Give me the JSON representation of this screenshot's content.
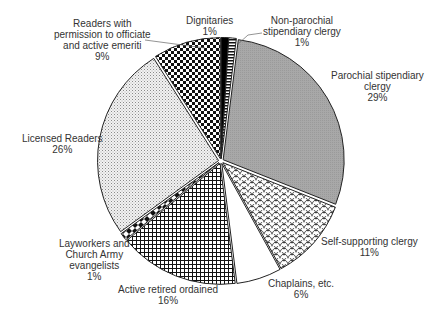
{
  "chart_data": {
    "type": "pie",
    "title": "",
    "start_angle_deg": 0,
    "direction": "clockwise",
    "slices": [
      {
        "label": "Dignitaries",
        "value": 1,
        "pct_label": "1%",
        "pattern": "solid-black"
      },
      {
        "label": "Non-parochial stipendiary clergy",
        "value": 1,
        "pct_label": "1%",
        "pattern": "horizontal-stripes"
      },
      {
        "label": "Parochial stipendiary clergy",
        "value": 29,
        "pct_label": "29%",
        "pattern": "solid-gray"
      },
      {
        "label": "Self-supporting clergy",
        "value": 11,
        "pct_label": "11%",
        "pattern": "scales"
      },
      {
        "label": "Chaplains, etc.",
        "value": 6,
        "pct_label": "6%",
        "pattern": "white"
      },
      {
        "label": "Active retired ordained",
        "value": 16,
        "pct_label": "16%",
        "pattern": "grid"
      },
      {
        "label": "Layworkers and Church Army evangelists",
        "value": 1,
        "pct_label": "1%",
        "pattern": "diamonds"
      },
      {
        "label": "Licensed Readers",
        "value": 26,
        "pct_label": "26%",
        "pattern": "fine-dots"
      },
      {
        "label": "Readers with permission to officiate and active emeriti",
        "value": 9,
        "pct_label": "9%",
        "pattern": "checker"
      }
    ],
    "legend": "none (direct labels)",
    "colors": {
      "gray": "#a6a6a6",
      "black": "#000000",
      "outline": "#222222",
      "text": "#333333"
    }
  },
  "labels": {
    "dignitaries": {
      "line1": "Dignitaries",
      "pct": "1%"
    },
    "nonparochial": {
      "line1": "Non-parochial",
      "line2": "stipendiary clergy",
      "pct": "1%"
    },
    "parochial": {
      "line1": "Parochial stipendiary",
      "line2": "clergy",
      "pct": "29%"
    },
    "selfsupporting": {
      "line1": "Self-supporting clergy",
      "pct": "11%"
    },
    "chaplains": {
      "line1": "Chaplains, etc.",
      "pct": "6%"
    },
    "activeretired": {
      "line1": "Active retired ordained",
      "pct": "16%"
    },
    "layworkers": {
      "line1": "Layworkers and",
      "line2": "Church Army",
      "line3": "evangelists",
      "pct": "1%"
    },
    "licensed": {
      "line1": "Licensed Readers",
      "pct": "26%"
    },
    "readersperm": {
      "line1": "Readers with",
      "line2": "permission to officiate",
      "line3": "and active emeriti",
      "pct": "9%"
    }
  }
}
